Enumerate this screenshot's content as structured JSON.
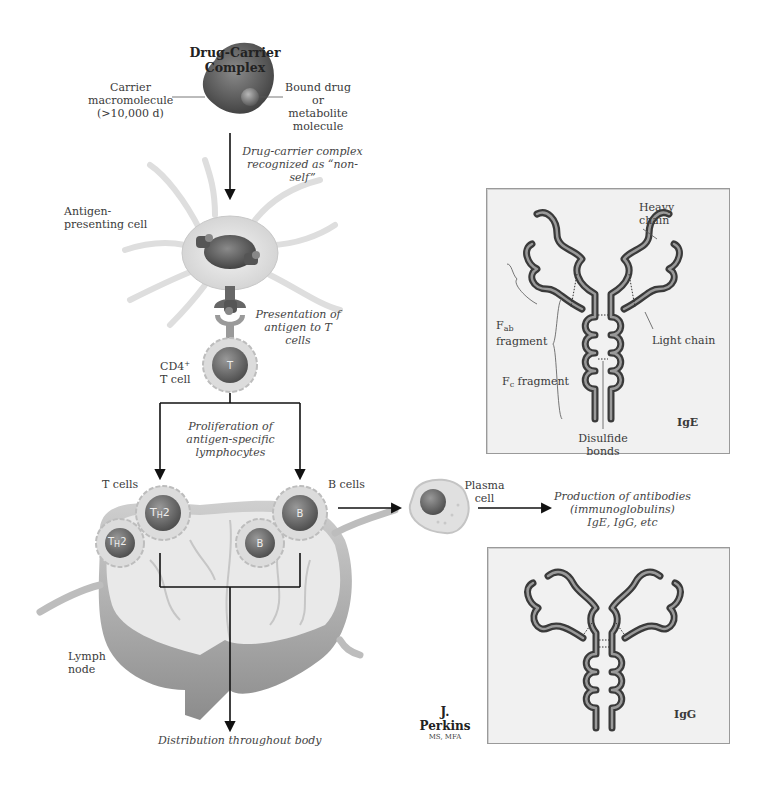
{
  "figure": {
    "title": "Drug-Carrier Complex",
    "signature": {
      "name": "J. Perkins",
      "credentials": "MS, MFA"
    }
  },
  "labels": {
    "carrier": [
      "Carrier",
      "macromolecule",
      "(>10,000 d)"
    ],
    "bound_drug": [
      "Bound drug",
      "or metabolite",
      "molecule"
    ],
    "recognized": [
      "Drug-carrier complex",
      "recognized as “non-self”"
    ],
    "apc": [
      "Antigen-",
      "presenting cell"
    ],
    "presentation": [
      "Presentation of",
      "antigen to T cells"
    ],
    "cd4_t_cell": {
      "line1": "CD4",
      "sup": "+",
      "line2": "T cell"
    },
    "t_cell_letter": "T",
    "proliferation": [
      "Proliferation of",
      "antigen-specific",
      "lymphocytes"
    ],
    "t_cells": "T cells",
    "b_cells": "B cells",
    "th2_letter": "T",
    "th2_sub": "H",
    "th2_num": "2",
    "b_letter": "B",
    "lymph_node": [
      "Lymph",
      "node"
    ],
    "distribution": "Distribution throughout body",
    "plasma_cell": [
      "Plasma",
      "cell"
    ],
    "production": [
      "Production of antibodies",
      "(immunoglobulins)",
      "IgE, IgG, etc"
    ]
  },
  "ige_panel": {
    "heavy_chain": [
      "Heavy",
      "chain"
    ],
    "light_chain": "Light chain",
    "fab": {
      "F": "F",
      "sub": "ab",
      "line2": "fragment"
    },
    "fc": {
      "F": "F",
      "sub": "c",
      "rest": " fragment"
    },
    "disulfide": "Disulfide bonds",
    "name": "IgE"
  },
  "igg_panel": {
    "name": "IgG"
  },
  "colors": {
    "chain_dark": "#3a3a3a",
    "chain_light": "#8a8a8a",
    "panel_bg": "#f1f1f1",
    "cell_dark": "#5a5a5a",
    "cell_membrane": "#d8d8d8",
    "arrow": "#111111"
  }
}
